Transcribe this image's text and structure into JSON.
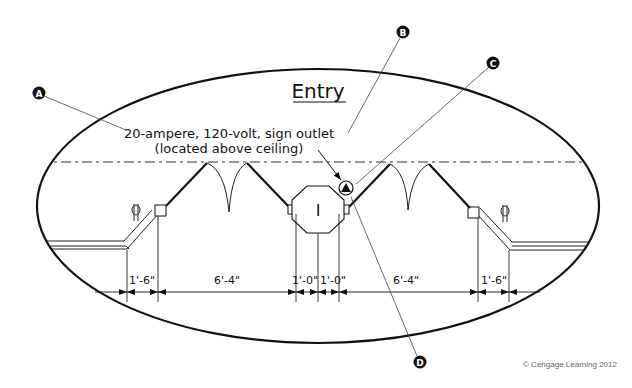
{
  "diagram": {
    "title": "Entry",
    "note_line1": "20-ampere, 120-volt, sign outlet",
    "note_line2": "(located above ceiling)",
    "callouts": [
      {
        "letter": "A"
      },
      {
        "letter": "B"
      },
      {
        "letter": "C"
      },
      {
        "letter": "D"
      }
    ],
    "center_symbol": "I",
    "dimensions": [
      "1'-6\"",
      "6'-4\"",
      "1'-0\"",
      "1'-0\"",
      "6'-4\"",
      "1'-6\""
    ],
    "copyright": "© Cengage Learning 2012",
    "colors": {
      "line": "#111111",
      "callout_fill": "#111111",
      "copyright": "#666666"
    }
  }
}
